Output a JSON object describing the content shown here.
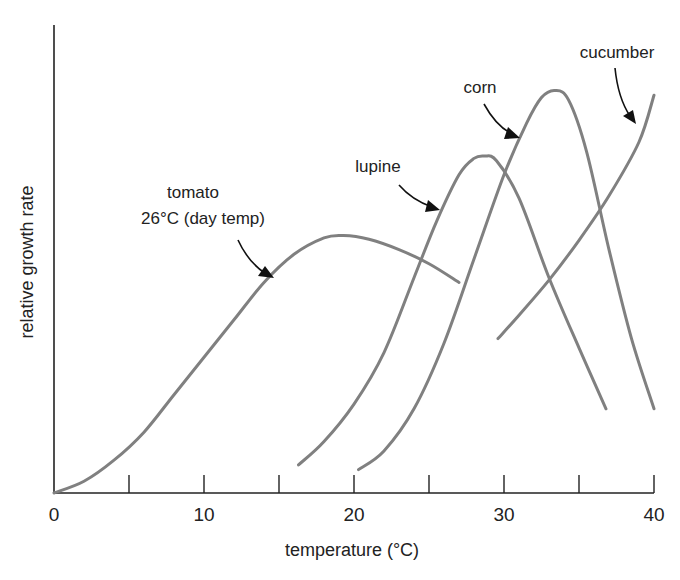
{
  "chart_data": {
    "type": "line",
    "title": "",
    "xlabel": "temperature (°C)",
    "ylabel": "relative growth rate",
    "xlim": [
      0,
      40
    ],
    "ylim": [
      0,
      100
    ],
    "x_ticks": [
      0,
      5,
      10,
      15,
      20,
      25,
      30,
      35,
      40
    ],
    "x_tick_labels": [
      "0",
      "10",
      "20",
      "30",
      "40"
    ],
    "x_tick_label_values": [
      0,
      10,
      20,
      30,
      40
    ],
    "y_ticks": [],
    "grid": false,
    "legend": "none (curves labeled by annotations)",
    "series": [
      {
        "name": "tomato",
        "label_lines": [
          "tomato",
          "26°C (day temp)"
        ],
        "x": [
          0,
          2,
          4,
          6,
          8,
          10,
          12,
          14,
          16,
          18,
          19.3,
          21,
          23,
          25,
          27
        ],
        "y": [
          0,
          2.5,
          7,
          13,
          21,
          29,
          37,
          45,
          51,
          54.5,
          55,
          54.2,
          52,
          49,
          45
        ]
      },
      {
        "name": "lupine",
        "label_lines": [
          "lupine"
        ],
        "x": [
          16.3,
          18,
          20,
          22,
          24,
          25.5,
          27,
          28,
          28.7,
          29.5,
          31,
          33,
          35,
          36.8
        ],
        "y": [
          6,
          11,
          19,
          30,
          46,
          58,
          68,
          71.5,
          72,
          71,
          63,
          46,
          31,
          18
        ]
      },
      {
        "name": "corn",
        "label_lines": [
          "corn"
        ],
        "x": [
          20.3,
          22,
          24,
          26,
          28,
          30,
          31.5,
          32.5,
          33.4,
          34.3,
          35.5,
          37,
          38.5,
          40
        ],
        "y": [
          5,
          9,
          18,
          32,
          50,
          68,
          79,
          84.5,
          86,
          84,
          73,
          52,
          33,
          18
        ]
      },
      {
        "name": "cucumber",
        "label_lines": [
          "cucumber"
        ],
        "x": [
          29.6,
          31,
          33,
          35,
          37,
          39,
          40
        ],
        "y": [
          33,
          38,
          45.5,
          54,
          63.5,
          75,
          85
        ]
      }
    ]
  }
}
